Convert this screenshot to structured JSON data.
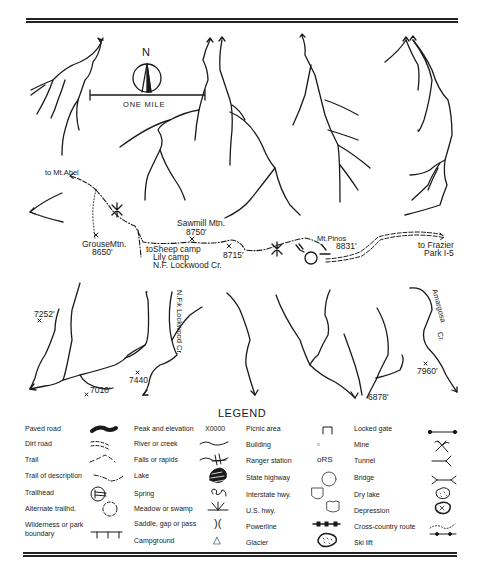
{
  "map": {
    "scale_label": "ONE MILE",
    "north_label": "N",
    "places": {
      "mt_abel": "to Mt.Abel",
      "grouse_mtn_name": "GrouseMtn.",
      "grouse_mtn_elev": "8650'",
      "sawmill_name": "Sawmill Mtn.",
      "sawmill_elev": "8750'",
      "sheep_camp_1": "toSheep camp",
      "sheep_camp_2": "Lily camp",
      "sheep_camp_3": "N.F. Lockwood Cr.",
      "elev_8715": "8715'",
      "mt_pinos_name": "Mt.Pinos",
      "mt_pinos_elev": "8831'",
      "frazier_1": "to Frazier",
      "frazier_2": "Park I-5",
      "elev_7252": "7252'",
      "elev_7010": "7010'",
      "elev_7440": "7440",
      "nf_lockwood": "N.F.k Lockwood Cr.",
      "elev_6878": "6878'",
      "amargosa": "Amargosa",
      "amargosa_cr": "Cr.",
      "elev_7960": "7960'"
    }
  },
  "legend": {
    "title": "LEGEND",
    "col1": [
      {
        "label": "Paved road",
        "icon": "paved-road-symbol"
      },
      {
        "label": "Dirt road",
        "icon": "dirt-road-symbol"
      },
      {
        "label": "Trail",
        "icon": "trail-symbol"
      },
      {
        "label": "Trail of description",
        "icon": "trail-of-description-symbol"
      },
      {
        "label": "Trailhead",
        "icon": "trailhead-symbol"
      },
      {
        "label": "Alternate trailhd.",
        "icon": "alternate-trailhead-symbol"
      },
      {
        "label": "Wilderness or park",
        "icon": "wilderness-boundary-symbol"
      },
      {
        "label": "boundary",
        "icon": ""
      }
    ],
    "col2": [
      {
        "label": "Peak and elevation",
        "icon_text": "X0000"
      },
      {
        "label": "River or creek",
        "icon": "river-symbol"
      },
      {
        "label": "Falls or rapids",
        "icon": "falls-symbol"
      },
      {
        "label": "Lake",
        "icon": "lake-symbol"
      },
      {
        "label": "Spring",
        "icon": "spring-symbol"
      },
      {
        "label": "Meadow or swamp",
        "icon": "meadow-symbol"
      },
      {
        "label": "Saddle, gap or pass",
        "icon_text": ")("
      },
      {
        "label": "Campground",
        "icon_text": "△"
      }
    ],
    "col3": [
      {
        "label": "Picnic area",
        "icon": "picnic-symbol"
      },
      {
        "label": "Building",
        "icon_text": "▫"
      },
      {
        "label": "Ranger station",
        "icon_text": "oRS"
      },
      {
        "label": "State highway",
        "icon": "state-highway-symbol"
      },
      {
        "label": "Interstate hwy.",
        "icon": "interstate-symbol"
      },
      {
        "label": "U.S. hwy.",
        "icon": "us-highway-symbol"
      },
      {
        "label": "Powerline",
        "icon": "powerline-symbol"
      },
      {
        "label": "Glacier",
        "icon": "glacier-symbol"
      }
    ],
    "col4": [
      {
        "label": "Locked gate",
        "icon": "locked-gate-symbol"
      },
      {
        "label": "Mine",
        "icon": "mine-symbol"
      },
      {
        "label": "Tunnel",
        "icon": "tunnel-symbol"
      },
      {
        "label": "Bridge",
        "icon": "bridge-symbol"
      },
      {
        "label": "Dry lake",
        "icon": "dry-lake-symbol"
      },
      {
        "label": "Depression",
        "icon": "depression-symbol"
      },
      {
        "label": "Cross-country route",
        "icon": "cross-country-symbol"
      },
      {
        "label": "Ski lift",
        "icon": "ski-lift-symbol"
      }
    ]
  },
  "colors": {
    "ink": "#1a1a1a",
    "background": "#ffffff"
  }
}
